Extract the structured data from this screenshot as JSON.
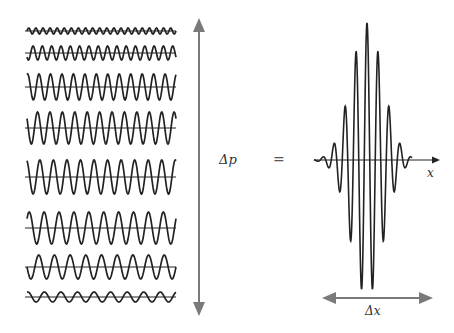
{
  "diagram": {
    "colors": {
      "wave": "#222222",
      "axis": "#222222",
      "arrow": "#7a7a7a",
      "background": "#ffffff"
    },
    "components": {
      "x_start": 27,
      "x_end": 176,
      "rows": [
        {
          "y": 31,
          "amplitude": 3,
          "cycles": 21,
          "phase": 0.0
        },
        {
          "y": 53,
          "amplitude": 7,
          "cycles": 16,
          "phase": 0.6
        },
        {
          "y": 87,
          "amplitude": 13,
          "cycles": 13,
          "phase": 0.2
        },
        {
          "y": 128,
          "amplitude": 16,
          "cycles": 12,
          "phase": 0.4
        },
        {
          "y": 177,
          "amplitude": 17,
          "cycles": 11,
          "phase": 0.3
        },
        {
          "y": 228,
          "amplitude": 16,
          "cycles": 10,
          "phase": 0.1
        },
        {
          "y": 267,
          "amplitude": 12,
          "cycles": 9.5,
          "phase": 0.5
        },
        {
          "y": 297,
          "amplitude": 5,
          "cycles": 9,
          "phase": 0.2
        }
      ]
    },
    "momentum_arrow": {
      "x": 199,
      "y_top": 18,
      "y_bottom": 316
    },
    "labels": {
      "delta_p": "Δp",
      "equals": "=",
      "x_axis": "x",
      "delta_x": "Δx"
    },
    "packet": {
      "axis_y": 160,
      "axis_x_start": 314,
      "axis_x_end": 440,
      "center_x": 367,
      "peak_amplitude": 137,
      "period": 11,
      "envelope_sigma": 16,
      "x_range": [
        314,
        412
      ]
    },
    "delta_x_arrow": {
      "y": 298,
      "x_start": 322,
      "x_end": 433
    }
  }
}
